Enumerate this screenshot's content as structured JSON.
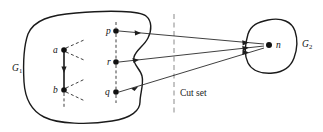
{
  "figure": {
    "kind": "graph-cut-set-diagram",
    "background_color": "#ffffff",
    "ink_color": "#111111",
    "cut_line_color": "#8a8a8a"
  },
  "regions": [
    {
      "id": "G1",
      "label": "G",
      "subscript": "1",
      "label_x": 17,
      "label_y": 68,
      "description": "left source region blob with wavy right edge"
    },
    {
      "id": "G2",
      "label": "G",
      "subscript": "2",
      "label_x": 300,
      "label_y": 44,
      "description": "right destination region blob"
    }
  ],
  "nodes": [
    {
      "id": "a",
      "label": "a",
      "x": 64,
      "y": 50,
      "label_x": 54,
      "label_y": 52,
      "r": 2.6
    },
    {
      "id": "b",
      "label": "b",
      "x": 64,
      "y": 90,
      "label_x": 54,
      "label_y": 92,
      "r": 2.6
    },
    {
      "id": "p",
      "label": "p",
      "x": 116,
      "y": 31,
      "label_x": 107,
      "label_y": 33,
      "r": 2.6
    },
    {
      "id": "r",
      "label": "r",
      "x": 116,
      "y": 62,
      "label_x": 107,
      "label_y": 64,
      "r": 2.6
    },
    {
      "id": "q",
      "label": "q",
      "x": 116,
      "y": 92,
      "label_x": 106,
      "label_y": 94,
      "r": 2.6
    },
    {
      "id": "n",
      "label": "n",
      "x": 269,
      "y": 45,
      "label_x": 276,
      "label_y": 48,
      "r": 2.8
    }
  ],
  "cut_set": {
    "label": "Cut set",
    "label_x": 180,
    "label_y": 93,
    "line_x": 174,
    "line_y1": 14,
    "line_y2": 115
  },
  "crossing_edges": [
    {
      "id": "p-to-n",
      "from": "p",
      "to": "n"
    },
    {
      "id": "r-to-n",
      "from": "r",
      "to": "n"
    },
    {
      "id": "q-to-n",
      "from": "q",
      "to": "n"
    }
  ],
  "internal_edges": [
    {
      "id": "a-to-b",
      "from": "a",
      "to": "b",
      "style": "solid"
    },
    {
      "id": "a-branch-up",
      "from": "a",
      "style": "dashed"
    },
    {
      "id": "a-branch-down",
      "from": "a",
      "style": "dashed"
    },
    {
      "id": "b-branch-up",
      "from": "b",
      "style": "dashed"
    },
    {
      "id": "b-branch-down",
      "from": "b",
      "style": "dashed"
    },
    {
      "id": "b-branch-bottom",
      "from": "b",
      "style": "dashed"
    },
    {
      "id": "p-to-r",
      "from": "p",
      "to": "r",
      "style": "dashed"
    },
    {
      "id": "r-to-q",
      "from": "r",
      "to": "q",
      "style": "dashed"
    }
  ]
}
